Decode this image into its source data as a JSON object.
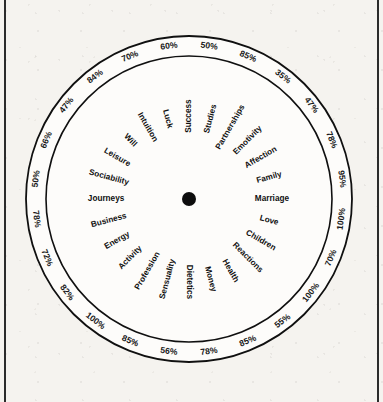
{
  "figure": {
    "frame": {
      "left_rule": "vertical-rule",
      "right_rule": "vertical-rule"
    }
  },
  "chart_data": {
    "type": "radar",
    "title": "",
    "subtitle": "",
    "xlabel": "",
    "ylabel": "",
    "value_unit": "%",
    "value_range": [
      0,
      100
    ],
    "grid": false,
    "legend": "none",
    "fill_color": "#9a9a9a",
    "line_color": "#101010",
    "background_color": "#f5f3ef",
    "outer_ring": true,
    "sector_count": 28,
    "start_angle_deg": -90,
    "direction": "clockwise",
    "categories": [
      "Success",
      "Studies",
      "Partnerships",
      "Emotivity",
      "Affection",
      "Family",
      "Marriage",
      "Love",
      "Children",
      "Reactions",
      "Health",
      "Money",
      "Dietetics",
      "Sensuality",
      "Profession",
      "Activity",
      "Energy",
      "Business",
      "Journeys",
      "Sociability",
      "Leisure",
      "Will",
      "Intuition",
      "Luck"
    ],
    "labels": [
      "Success",
      "Studies",
      "Partnerships",
      "Emotivity",
      "Affection",
      "Family",
      "Marriage",
      "Love",
      "Children",
      "Reactions",
      "Health",
      "Money",
      "Dietetics",
      "Sensuality",
      "Profession",
      "Activity",
      "Energy",
      "Business",
      "Journeys",
      "Sociability",
      "Leisure",
      "Will",
      "Intuition",
      "Luck"
    ],
    "values": [
      50,
      85,
      35,
      47,
      78,
      95,
      100,
      70,
      100,
      55,
      85,
      78,
      56,
      85,
      100,
      82,
      72,
      78,
      50,
      66,
      47,
      84,
      70,
      60
    ],
    "value_labels": [
      "50%",
      "85%",
      "35%",
      "47%",
      "78%",
      "95%",
      "100%",
      "70%",
      "100%",
      "55%",
      "85%",
      "78%",
      "56%",
      "85%",
      "100%",
      "82%",
      "72%",
      "78%",
      "50%",
      "66%",
      "47%",
      "84%",
      "70%",
      "60%"
    ]
  },
  "geometry": {
    "center_x": 189,
    "center_y": 199,
    "outer_radius": 163,
    "inner_radius": 143,
    "hub_radius": 7
  }
}
